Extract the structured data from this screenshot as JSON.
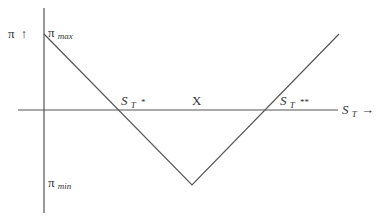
{
  "diagram": {
    "type": "payoff-diagram",
    "y_axis": {
      "symbol": "π",
      "arrow": "↑"
    },
    "x_axis": {
      "symbol": "S",
      "subscript": "T",
      "arrow": "→"
    },
    "labels": {
      "pi_max": {
        "base": "π",
        "sub": "max"
      },
      "pi_min": {
        "base": "π",
        "sub": "min"
      },
      "breakeven_low": {
        "base": "S",
        "sub": "T",
        "suffix": "*"
      },
      "strike": {
        "text": "X"
      },
      "breakeven_high": {
        "base": "S",
        "sub": "T",
        "suffix": "**"
      }
    },
    "curve": {
      "description": "V-shaped profit line",
      "points_data": [
        {
          "name": "pi_max_at_zero",
          "S": 0,
          "profit": "π_max"
        },
        {
          "name": "breakeven_low",
          "S": "S_T*",
          "profit": 0
        },
        {
          "name": "strike_min",
          "S": "X",
          "profit": "π_min"
        },
        {
          "name": "breakeven_high",
          "S": "S_T**",
          "profit": 0
        }
      ]
    }
  }
}
